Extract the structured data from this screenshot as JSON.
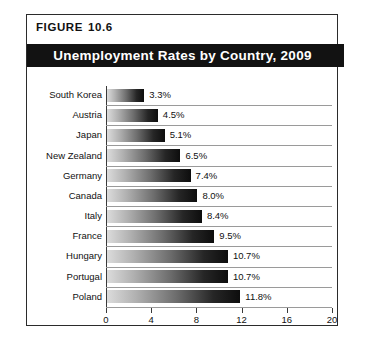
{
  "figure": {
    "label_word": "FIGURE",
    "number": "10.6"
  },
  "chart_data": {
    "type": "bar",
    "orientation": "horizontal",
    "title": "Unemployment Rates by Country, 2009",
    "xlabel": "",
    "ylabel": "",
    "xlim": [
      0,
      20
    ],
    "xticks": [
      0,
      4,
      8,
      12,
      16,
      20
    ],
    "xtick_labels": [
      "0",
      "4",
      "8",
      "12",
      "16",
      "20"
    ],
    "grid": "horizontal-row-separators",
    "legend": "none",
    "categories": [
      "South Korea",
      "Austria",
      "Japan",
      "New Zealand",
      "Germany",
      "Canada",
      "Italy",
      "France",
      "Hungary",
      "Portugal",
      "Poland"
    ],
    "values": [
      3.3,
      4.5,
      5.1,
      6.5,
      7.4,
      8.0,
      8.4,
      9.5,
      10.7,
      10.7,
      11.8
    ],
    "value_labels": [
      "3.3%",
      "4.5%",
      "5.1%",
      "6.5%",
      "7.4%",
      "8.0%",
      "8.4%",
      "9.5%",
      "10.7%",
      "10.7%",
      "11.8%"
    ]
  },
  "colors": {
    "banner_background": "#121212",
    "banner_text": "#ffffff",
    "frame_border": "#2b2b2b",
    "axis_line": "#3a3a3a",
    "row_separator": "#9a9a9a",
    "bar_gradient_start": "#dcdcdc",
    "bar_gradient_end": "#0d0d0d",
    "page_background": "#ffffff",
    "text": "#111111"
  }
}
